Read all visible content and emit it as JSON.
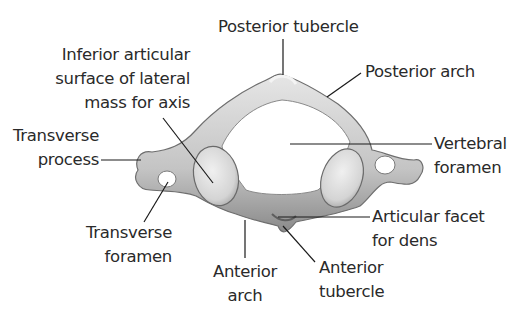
{
  "diagram": {
    "labels": {
      "posterior_tubercle": [
        "Posterior tubercle"
      ],
      "posterior_arch": [
        "Posterior arch"
      ],
      "inferior_articular_surface": [
        "Inferior articular",
        "surface of lateral",
        "mass for axis"
      ],
      "transverse_process": [
        "Transverse",
        "process"
      ],
      "vertebral_foramen": [
        "Vertebral",
        "foramen"
      ],
      "transverse_foramen": [
        "Transverse",
        "foramen"
      ],
      "articular_facet_for_dens": [
        "Articular facet",
        "for dens"
      ],
      "anterior_arch": [
        "Anterior",
        "arch"
      ],
      "anterior_tubercle": [
        "Anterior",
        "tubercle"
      ]
    },
    "colors": {
      "bone_light": "#e4e4e4",
      "bone_mid": "#bdbdbd",
      "bone_dark": "#7d7d7d",
      "leader_line": "#1a1a1a",
      "text": "#2a2a2a",
      "background": "#ffffff"
    }
  }
}
